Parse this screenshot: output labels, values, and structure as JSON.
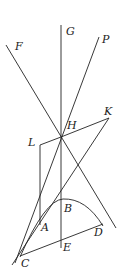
{
  "diagram": {
    "type": "geometry-figure",
    "labels": [
      {
        "id": "G",
        "text": "G",
        "x": 66,
        "y": 26
      },
      {
        "id": "F",
        "text": "F",
        "x": 15,
        "y": 42
      },
      {
        "id": "P",
        "text": "P",
        "x": 101,
        "y": 35
      },
      {
        "id": "K",
        "text": "K",
        "x": 104,
        "y": 106
      },
      {
        "id": "H",
        "text": "H",
        "x": 67,
        "y": 119
      },
      {
        "id": "L",
        "text": "L",
        "x": 28,
        "y": 136
      },
      {
        "id": "B",
        "text": "B",
        "x": 63,
        "y": 204
      },
      {
        "id": "A",
        "text": "A",
        "x": 41,
        "y": 221
      },
      {
        "id": "D",
        "text": "D",
        "x": 94,
        "y": 226
      },
      {
        "id": "E",
        "text": "E",
        "x": 63,
        "y": 241
      },
      {
        "id": "C",
        "text": "C",
        "x": 21,
        "y": 257
      }
    ],
    "stroke_color": "#222222"
  }
}
